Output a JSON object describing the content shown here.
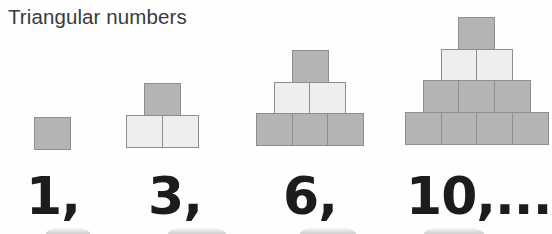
{
  "figure": {
    "title": "Triangular numbers",
    "background_color": "#fefefe",
    "title_color": "#3a3a3a",
    "numeral_color": "#1c1c1c",
    "cube_border_color": "#8e8e8e",
    "cube_fill_dark": "#b4b4b4",
    "cube_fill_light": "#eeeeee"
  },
  "chart_data": {
    "type": "diagram",
    "title": "Triangular numbers",
    "xlabel": "",
    "ylabel": "",
    "categories": [
      "1",
      "3",
      "6",
      "10"
    ],
    "values": [
      1,
      3,
      6,
      10
    ],
    "groups": [
      {
        "index": 1,
        "label": "1,",
        "total_squares": 1,
        "rows": [
          {
            "count": 1,
            "shade": "dark"
          }
        ]
      },
      {
        "index": 2,
        "label": "3,",
        "total_squares": 3,
        "rows": [
          {
            "count": 1,
            "shade": "dark"
          },
          {
            "count": 2,
            "shade": "light"
          }
        ]
      },
      {
        "index": 3,
        "label": "6,",
        "total_squares": 6,
        "rows": [
          {
            "count": 1,
            "shade": "dark"
          },
          {
            "count": 2,
            "shade": "light"
          },
          {
            "count": 3,
            "shade": "dark"
          }
        ]
      },
      {
        "index": 4,
        "label": "10,...",
        "total_squares": 10,
        "rows": [
          {
            "count": 1,
            "shade": "dark"
          },
          {
            "count": 2,
            "shade": "light"
          },
          {
            "count": 3,
            "shade": "dark"
          },
          {
            "count": 4,
            "shade": "dark"
          }
        ]
      }
    ]
  }
}
